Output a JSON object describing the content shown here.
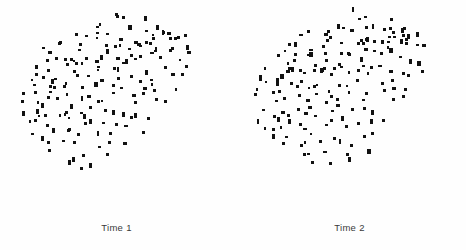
{
  "figure": {
    "background_color": "#ffffff",
    "marker_color": "#111111",
    "label_color": "#3a3a3a",
    "width": 466,
    "height": 250
  },
  "panels": [
    {
      "label": "Time 1",
      "name": "panel-time-1"
    },
    {
      "label": "Time 2",
      "name": "panel-time-2"
    }
  ],
  "chart_data": {
    "type": "scatter",
    "title": "",
    "xlabel": "",
    "ylabel": "",
    "grid": false,
    "legend": "none",
    "axes_visible": false,
    "tick_labels": [],
    "marker": "square",
    "marker_size_px": 3,
    "marker_color": "#111111",
    "xlim": [
      0,
      233
    ],
    "ylim": [
      0,
      212
    ],
    "panels": [
      {
        "name": "Time 1",
        "n_points": 186,
        "x": [
          112,
          118,
          120,
          125,
          129,
          104,
          98,
          139,
          151,
          92,
          107,
          133,
          88,
          116,
          160,
          57,
          63,
          70,
          145,
          168,
          43,
          50,
          78,
          95,
          123,
          155,
          171,
          180,
          36,
          61,
          74,
          83,
          101,
          127,
          141,
          163,
          186,
          30,
          47,
          55,
          68,
          86,
          110,
          130,
          149,
          176,
          190,
          27,
          40,
          52,
          66,
          79,
          94,
          105,
          119,
          136,
          152,
          167,
          182,
          193,
          24,
          38,
          49,
          59,
          72,
          85,
          99,
          113,
          126,
          143,
          158,
          174,
          188,
          197,
          22,
          34,
          45,
          57,
          70,
          81,
          93,
          108,
          121,
          135,
          150,
          165,
          179,
          192,
          200,
          21,
          32,
          43,
          54,
          65,
          77,
          89,
          102,
          115,
          128,
          142,
          156,
          170,
          184,
          196,
          23,
          35,
          46,
          58,
          69,
          80,
          91,
          104,
          117,
          131,
          146,
          161,
          175,
          189,
          26,
          37,
          48,
          60,
          71,
          83,
          96,
          109,
          122,
          137,
          151,
          166,
          181,
          29,
          41,
          53,
          64,
          76,
          88,
          100,
          113,
          127,
          141,
          155,
          169,
          183,
          33,
          44,
          56,
          67,
          78,
          90,
          103,
          116,
          129,
          143,
          157,
          171,
          39,
          51,
          62,
          73,
          84,
          97,
          110,
          124,
          138,
          152,
          166,
          48,
          59,
          70,
          82,
          94,
          107,
          120,
          134,
          148,
          63,
          75,
          87,
          99,
          112,
          126,
          140,
          80,
          92,
          105
        ],
        "y": [
          12,
          18,
          15,
          10,
          21,
          24,
          27,
          16,
          20,
          30,
          33,
          29,
          38,
          35,
          31,
          44,
          41,
          37,
          34,
          28,
          52,
          48,
          45,
          42,
          40,
          36,
          32,
          26,
          60,
          56,
          53,
          50,
          47,
          43,
          39,
          35,
          30,
          68,
          64,
          61,
          58,
          55,
          51,
          46,
          41,
          36,
          31,
          76,
          72,
          69,
          66,
          62,
          59,
          54,
          49,
          44,
          40,
          34,
          29,
          25,
          84,
          80,
          77,
          74,
          70,
          67,
          63,
          57,
          52,
          47,
          42,
          37,
          32,
          27,
          92,
          88,
          85,
          82,
          78,
          75,
          71,
          65,
          60,
          55,
          50,
          45,
          39,
          33,
          28,
          100,
          96,
          93,
          90,
          86,
          83,
          79,
          73,
          68,
          63,
          58,
          53,
          48,
          43,
          38,
          108,
          104,
          101,
          98,
          94,
          91,
          87,
          81,
          76,
          71,
          66,
          61,
          56,
          51,
          116,
          112,
          109,
          106,
          102,
          99,
          95,
          89,
          84,
          79,
          74,
          69,
          64,
          124,
          120,
          117,
          114,
          110,
          107,
          103,
          97,
          92,
          87,
          82,
          77,
          72,
          132,
          128,
          125,
          122,
          118,
          115,
          111,
          105,
          100,
          95,
          90,
          85,
          140,
          136,
          133,
          130,
          127,
          123,
          119,
          113,
          108,
          103,
          98,
          148,
          144,
          141,
          138,
          134,
          131,
          126,
          121,
          116,
          156,
          152,
          149,
          146,
          143,
          139,
          135,
          164,
          160,
          157
        ]
      },
      {
        "name": "Time 2",
        "n_points": 190,
        "x": [
          115,
          121,
          128,
          134,
          140,
          106,
          99,
          146,
          153,
          93,
          108,
          136,
          90,
          118,
          161,
          60,
          66,
          73,
          148,
          170,
          46,
          53,
          80,
          97,
          125,
          157,
          173,
          182,
          39,
          64,
          77,
          86,
          104,
          129,
          143,
          165,
          188,
          33,
          50,
          58,
          71,
          89,
          112,
          132,
          151,
          178,
          192,
          30,
          43,
          55,
          69,
          82,
          96,
          107,
          121,
          138,
          154,
          169,
          184,
          195,
          27,
          41,
          52,
          62,
          75,
          88,
          101,
          115,
          128,
          145,
          160,
          176,
          190,
          199,
          25,
          37,
          48,
          60,
          73,
          84,
          95,
          110,
          123,
          137,
          152,
          167,
          181,
          194,
          202,
          24,
          35,
          46,
          57,
          68,
          80,
          92,
          105,
          118,
          131,
          144,
          158,
          172,
          186,
          198,
          26,
          38,
          49,
          61,
          72,
          83,
          94,
          107,
          120,
          133,
          148,
          163,
          177,
          191,
          29,
          40,
          51,
          63,
          74,
          86,
          99,
          112,
          125,
          139,
          153,
          168,
          183,
          32,
          44,
          56,
          67,
          79,
          91,
          103,
          116,
          130,
          144,
          158,
          172,
          186,
          36,
          47,
          59,
          70,
          81,
          93,
          106,
          119,
          132,
          146,
          160,
          174,
          42,
          54,
          65,
          76,
          87,
          100,
          113,
          127,
          141,
          155,
          169,
          51,
          62,
          73,
          85,
          97,
          110,
          123,
          137,
          151,
          66,
          78,
          90,
          102,
          115,
          129,
          143,
          83,
          95,
          108,
          120,
          133
        ],
        "y": [
          10,
          16,
          13,
          8,
          19,
          22,
          25,
          14,
          18,
          28,
          31,
          27,
          36,
          33,
          29,
          42,
          39,
          35,
          32,
          26,
          50,
          46,
          43,
          40,
          38,
          34,
          30,
          24,
          58,
          54,
          51,
          48,
          45,
          41,
          37,
          33,
          28,
          66,
          62,
          59,
          56,
          53,
          49,
          44,
          39,
          34,
          29,
          74,
          70,
          67,
          64,
          60,
          57,
          52,
          47,
          42,
          38,
          32,
          27,
          23,
          82,
          78,
          75,
          72,
          68,
          65,
          61,
          55,
          50,
          45,
          40,
          35,
          30,
          25,
          90,
          86,
          83,
          80,
          76,
          73,
          69,
          63,
          58,
          53,
          48,
          43,
          37,
          31,
          26,
          98,
          94,
          91,
          88,
          84,
          81,
          77,
          71,
          66,
          61,
          56,
          51,
          46,
          41,
          36,
          106,
          102,
          99,
          96,
          92,
          89,
          85,
          79,
          74,
          69,
          64,
          59,
          54,
          49,
          114,
          110,
          107,
          104,
          100,
          97,
          93,
          87,
          82,
          77,
          72,
          67,
          62,
          122,
          118,
          115,
          112,
          108,
          105,
          101,
          95,
          90,
          85,
          80,
          75,
          70,
          130,
          126,
          123,
          120,
          116,
          113,
          109,
          103,
          98,
          93,
          88,
          83,
          138,
          134,
          131,
          128,
          124,
          121,
          117,
          111,
          106,
          101,
          96,
          146,
          142,
          139,
          136,
          132,
          129,
          124,
          119,
          114,
          154,
          150,
          147,
          144,
          141,
          137,
          133,
          162,
          158,
          155,
          152,
          148
        ]
      }
    ]
  }
}
